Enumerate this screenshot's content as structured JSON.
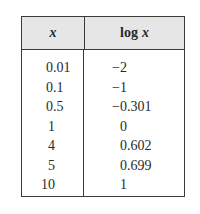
{
  "table": {
    "headers": {
      "x": "x",
      "log_prefix": "log",
      "log_var": "x"
    },
    "rows": [
      {
        "x": "0.01",
        "logx": "−2"
      },
      {
        "x": "0.1",
        "logx": "−1"
      },
      {
        "x": "0.5",
        "logx": "−0.301"
      },
      {
        "x": "1",
        "logx": "0"
      },
      {
        "x": "4",
        "logx": "0.602"
      },
      {
        "x": "5",
        "logx": "0.699"
      },
      {
        "x": "10",
        "logx": "1"
      }
    ]
  }
}
